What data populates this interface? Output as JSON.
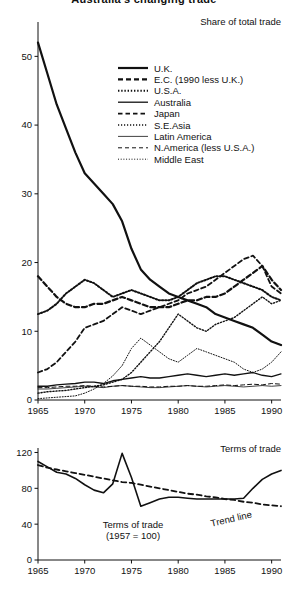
{
  "page": {
    "clipped_title": "Australia's changing trade"
  },
  "chart_data": [
    {
      "id": "share-of-total-trade",
      "type": "line",
      "title": "Share of total trade",
      "xlabel": "",
      "ylabel": "",
      "xlim": [
        1965,
        1991
      ],
      "ylim": [
        0,
        55
      ],
      "xticks": [
        1965,
        1970,
        1975,
        1980,
        1985,
        1990
      ],
      "yticks": [
        0,
        10,
        20,
        30,
        40,
        50
      ],
      "grid": false,
      "legend_position": "upper-right-inside",
      "x": [
        1965,
        1966,
        1967,
        1968,
        1969,
        1970,
        1971,
        1972,
        1973,
        1974,
        1975,
        1976,
        1977,
        1978,
        1979,
        1980,
        1981,
        1982,
        1983,
        1984,
        1985,
        1986,
        1987,
        1988,
        1989,
        1990,
        1991
      ],
      "series": [
        {
          "name": "U.K.",
          "style": "solid-thick",
          "values": [
            52.0,
            47.5,
            43.0,
            39.5,
            36.0,
            33.0,
            31.5,
            30.0,
            28.5,
            26.0,
            22.0,
            19.0,
            17.5,
            16.5,
            15.5,
            15.0,
            14.5,
            14.0,
            13.5,
            12.5,
            12.0,
            11.5,
            11.0,
            10.5,
            9.5,
            8.5,
            8.0
          ]
        },
        {
          "name": "E.C. (1990 less U.K.)",
          "style": "dashed-thick",
          "values": [
            18.0,
            16.5,
            15.0,
            14.0,
            13.5,
            13.5,
            14.0,
            14.0,
            14.5,
            15.0,
            14.5,
            14.0,
            13.5,
            13.5,
            13.5,
            14.0,
            14.5,
            14.5,
            15.0,
            15.0,
            15.5,
            16.5,
            17.5,
            18.5,
            19.5,
            17.5,
            16.0
          ]
        },
        {
          "name": "U.S.A.",
          "style": "dotted-thick",
          "values": [
            12.5,
            13.0,
            14.0,
            15.5,
            16.5,
            17.5,
            17.0,
            16.0,
            15.0,
            15.5,
            16.0,
            15.5,
            15.0,
            14.5,
            14.5,
            15.0,
            16.0,
            17.0,
            17.5,
            18.0,
            18.0,
            17.5,
            17.0,
            16.5,
            16.0,
            15.0,
            14.5
          ]
        },
        {
          "name": "Australia",
          "style": "solid-thin",
          "values": [
            2.0,
            2.0,
            2.2,
            2.3,
            2.4,
            2.6,
            2.6,
            2.4,
            2.8,
            3.0,
            3.2,
            3.4,
            3.2,
            3.2,
            3.4,
            3.6,
            3.8,
            3.6,
            3.4,
            3.6,
            3.8,
            3.6,
            3.8,
            4.0,
            3.6,
            3.4,
            3.8
          ]
        },
        {
          "name": "Japan",
          "style": "dashed-medium",
          "values": [
            4.0,
            4.5,
            5.5,
            7.0,
            8.5,
            10.5,
            11.0,
            11.5,
            12.5,
            13.5,
            13.0,
            12.5,
            13.0,
            13.5,
            14.0,
            14.5,
            15.5,
            16.0,
            16.5,
            17.5,
            18.5,
            19.5,
            20.5,
            21.0,
            19.5,
            16.5,
            15.5
          ]
        },
        {
          "name": "S.E.Asia",
          "style": "dotted-thin",
          "values": [
            1.0,
            1.2,
            1.3,
            1.4,
            1.6,
            1.8,
            2.0,
            2.2,
            2.6,
            3.0,
            4.0,
            5.5,
            7.0,
            8.5,
            10.5,
            12.5,
            11.5,
            10.5,
            10.0,
            11.0,
            11.5,
            12.0,
            13.0,
            14.0,
            15.0,
            14.0,
            14.5
          ]
        },
        {
          "name": "Latin America",
          "style": "solid-hairline",
          "values": [
            1.6,
            1.6,
            1.7,
            1.8,
            1.9,
            2.0,
            1.9,
            1.8,
            2.0,
            2.1,
            2.0,
            1.9,
            1.8,
            1.8,
            1.9,
            2.0,
            2.1,
            2.0,
            1.9,
            2.0,
            2.1,
            2.0,
            1.9,
            2.0,
            2.1,
            2.0,
            2.1
          ]
        },
        {
          "name": "N.America (less U.S.A.)",
          "style": "dashed-thin",
          "values": [
            1.8,
            1.8,
            1.9,
            2.0,
            2.0,
            2.1,
            2.0,
            1.9,
            2.0,
            2.1,
            2.0,
            2.0,
            1.9,
            1.9,
            2.0,
            2.0,
            2.1,
            2.0,
            2.0,
            2.1,
            2.2,
            2.1,
            2.2,
            2.3,
            2.2,
            2.4,
            2.3
          ]
        },
        {
          "name": "Middle East",
          "style": "dotted-hairline",
          "values": [
            0.2,
            0.3,
            0.4,
            0.5,
            0.6,
            1.0,
            1.6,
            2.4,
            3.5,
            5.0,
            7.5,
            9.0,
            8.0,
            7.0,
            6.0,
            5.5,
            6.5,
            7.5,
            7.0,
            6.5,
            6.0,
            5.5,
            4.5,
            4.0,
            4.5,
            5.5,
            7.0
          ]
        }
      ]
    },
    {
      "id": "terms-of-trade",
      "type": "line",
      "title": "Terms of trade",
      "xlabel": "",
      "ylabel": "",
      "xlim": [
        1965,
        1991
      ],
      "ylim": [
        0,
        125
      ],
      "xticks": [
        1965,
        1970,
        1975,
        1980,
        1985,
        1990
      ],
      "yticks": [
        0,
        40,
        80,
        120
      ],
      "grid": false,
      "annotations": [
        {
          "text": "Terms of trade",
          "sub": "(1957 = 100)"
        },
        {
          "text": "Trend line"
        }
      ],
      "x": [
        1965,
        1966,
        1967,
        1968,
        1969,
        1970,
        1971,
        1972,
        1973,
        1974,
        1975,
        1976,
        1977,
        1978,
        1979,
        1980,
        1981,
        1982,
        1983,
        1984,
        1985,
        1986,
        1987,
        1988,
        1989,
        1990,
        1991
      ],
      "series": [
        {
          "name": "Terms of trade (1957 = 100)",
          "style": "solid",
          "values": [
            110,
            104,
            98,
            96,
            91,
            84,
            78,
            75,
            85,
            119,
            92,
            60,
            64,
            68,
            70,
            70,
            69,
            68,
            68,
            68,
            68,
            68,
            69,
            80,
            90,
            96,
            100
          ]
        },
        {
          "name": "Trend line",
          "style": "dashed",
          "values": [
            106,
            103,
            101,
            99,
            97,
            95,
            93,
            91,
            89,
            87,
            86,
            84,
            82,
            80,
            78,
            76,
            74,
            73,
            71,
            70,
            68,
            67,
            65,
            64,
            62,
            61,
            60
          ]
        }
      ]
    }
  ],
  "legend": {
    "items": [
      {
        "label": "U.K.",
        "style": "solid-thick"
      },
      {
        "label": "E.C. (1990 less U.K.)",
        "style": "dashed-thick"
      },
      {
        "label": "U.S.A.",
        "style": "dotted-thick"
      },
      {
        "label": "Australia",
        "style": "solid-thin"
      },
      {
        "label": "Japan",
        "style": "dashed-medium"
      },
      {
        "label": "S.E.Asia",
        "style": "dotted-thin"
      },
      {
        "label": "Latin America",
        "style": "solid-hairline"
      },
      {
        "label": "N.America (less U.S.A.)",
        "style": "dashed-thin"
      },
      {
        "label": "Middle East",
        "style": "dotted-hairline"
      }
    ]
  },
  "top_chart": {
    "title": "Share of total trade",
    "yticks": [
      "50",
      "40",
      "30",
      "20",
      "10",
      "0"
    ],
    "xticks": [
      "1965",
      "1970",
      "1975",
      "1980",
      "1985",
      "1990"
    ]
  },
  "bottom_chart": {
    "title": "Terms of trade",
    "yticks": [
      "120",
      "80",
      "40",
      "0"
    ],
    "xticks": [
      "1965",
      "1970",
      "1975",
      "1980",
      "1985",
      "1990"
    ],
    "annot_series": "Terms of trade",
    "annot_series_sub": "(1957 = 100)",
    "annot_trend": "Trend line"
  }
}
